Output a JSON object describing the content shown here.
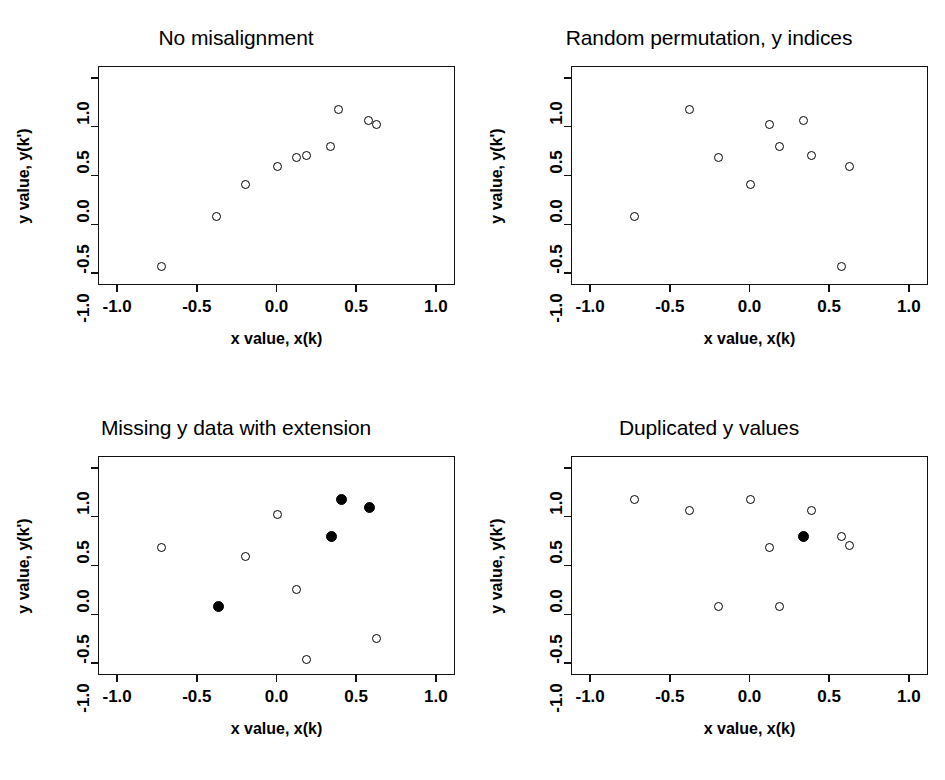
{
  "figure": {
    "layout": "2x2 panel grid",
    "axis": {
      "xlabel": "x value, x(k)",
      "ylabel": "y value, y(k')",
      "xticks": [
        "-1.0",
        "-0.5",
        "0.0",
        "0.5",
        "1.0"
      ],
      "xtick_values": [
        -1.0,
        -0.5,
        0.0,
        0.5,
        1.0
      ],
      "yticks": [
        "-1.0",
        "-0.5",
        "0.0",
        "0.5",
        "1.0"
      ],
      "ytick_values": [
        -1.0,
        -0.5,
        0.0,
        0.5,
        1.0
      ],
      "xlim": [
        -1.12,
        1.12
      ],
      "ylim": [
        -1.12,
        1.12
      ]
    },
    "colors": {
      "foreground": "#000000",
      "background": "#ffffff",
      "marker_open": "#ffffff",
      "marker_filled": "#000000"
    }
  },
  "chart_data": [
    {
      "type": "scatter",
      "panel": 1,
      "title": "No misalignment",
      "xlabel": "x value, x(k)",
      "ylabel": "y value, y(k')",
      "xlim": [
        -1.12,
        1.12
      ],
      "ylim": [
        -1.12,
        1.12
      ],
      "grid": false,
      "legend": null,
      "series": [
        {
          "name": "aligned pairs",
          "marker": "open-circle",
          "points": [
            {
              "x": -0.73,
              "y": -0.92
            },
            {
              "x": -0.38,
              "y": -0.41
            },
            {
              "x": -0.2,
              "y": -0.08
            },
            {
              "x": 0.0,
              "y": 0.1
            },
            {
              "x": 0.12,
              "y": 0.19
            },
            {
              "x": 0.18,
              "y": 0.21
            },
            {
              "x": 0.33,
              "y": 0.31
            },
            {
              "x": 0.38,
              "y": 0.69
            },
            {
              "x": 0.57,
              "y": 0.57
            },
            {
              "x": 0.62,
              "y": 0.53
            }
          ]
        }
      ]
    },
    {
      "type": "scatter",
      "panel": 2,
      "title": "Random permutation, y indices",
      "xlabel": "x value, x(k)",
      "ylabel": "y value, y(k')",
      "xlim": [
        -1.12,
        1.12
      ],
      "ylim": [
        -1.12,
        1.12
      ],
      "grid": false,
      "legend": null,
      "series": [
        {
          "name": "permuted pairs",
          "marker": "open-circle",
          "points": [
            {
              "x": -0.73,
              "y": -0.41
            },
            {
              "x": -0.38,
              "y": 0.69
            },
            {
              "x": -0.2,
              "y": 0.19
            },
            {
              "x": 0.0,
              "y": -0.08
            },
            {
              "x": 0.12,
              "y": 0.53
            },
            {
              "x": 0.18,
              "y": 0.31
            },
            {
              "x": 0.33,
              "y": 0.57
            },
            {
              "x": 0.38,
              "y": 0.21
            },
            {
              "x": 0.57,
              "y": -0.92
            },
            {
              "x": 0.62,
              "y": 0.1
            }
          ]
        }
      ]
    },
    {
      "type": "scatter",
      "panel": 3,
      "title": "Missing y data with extension",
      "xlabel": "x value, x(k)",
      "ylabel": "y value, y(k')",
      "xlim": [
        -1.12,
        1.12
      ],
      "ylim": [
        -1.12,
        1.12
      ],
      "grid": false,
      "legend": null,
      "series": [
        {
          "name": "observed y",
          "marker": "open-circle",
          "points": [
            {
              "x": -0.73,
              "y": 0.19
            },
            {
              "x": -0.2,
              "y": 0.1
            },
            {
              "x": 0.0,
              "y": 0.53
            },
            {
              "x": 0.12,
              "y": -0.24
            },
            {
              "x": 0.18,
              "y": -0.95
            },
            {
              "x": 0.62,
              "y": -0.74
            }
          ]
        },
        {
          "name": "extended y",
          "marker": "filled-circle",
          "points": [
            {
              "x": -0.37,
              "y": -0.41
            },
            {
              "x": 0.34,
              "y": 0.31
            },
            {
              "x": 0.4,
              "y": 0.69
            },
            {
              "x": 0.58,
              "y": 0.6
            }
          ]
        }
      ]
    },
    {
      "type": "scatter",
      "panel": 4,
      "title": "Duplicated y values",
      "xlabel": "x value, x(k)",
      "ylabel": "y value, y(k')",
      "xlim": [
        -1.12,
        1.12
      ],
      "ylim": [
        -1.12,
        1.12
      ],
      "grid": false,
      "legend": null,
      "series": [
        {
          "name": "y values",
          "marker": "open-circle",
          "points": [
            {
              "x": -0.73,
              "y": 0.69
            },
            {
              "x": -0.38,
              "y": 0.57
            },
            {
              "x": -0.2,
              "y": -0.41
            },
            {
              "x": 0.0,
              "y": 0.69
            },
            {
              "x": 0.12,
              "y": 0.19
            },
            {
              "x": 0.18,
              "y": -0.41
            },
            {
              "x": 0.38,
              "y": 0.57
            },
            {
              "x": 0.57,
              "y": 0.31
            },
            {
              "x": 0.62,
              "y": 0.21
            }
          ]
        },
        {
          "name": "duplicated y",
          "marker": "filled-circle",
          "points": [
            {
              "x": 0.33,
              "y": 0.31
            }
          ]
        }
      ]
    }
  ]
}
